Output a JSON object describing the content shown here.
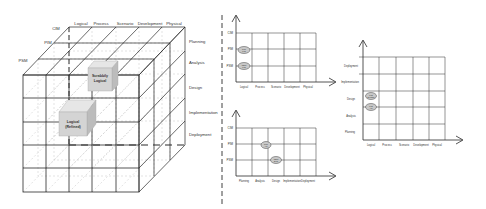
{
  "cube": {
    "depth_labels": [
      "CIM",
      "PIM",
      "PSM"
    ],
    "top_labels": [
      "Logical",
      "Process",
      "Scenario",
      "Development",
      "Physical"
    ],
    "side_labels": [
      "Planning",
      "Analysis",
      "Design",
      "Implementation",
      "Deployment"
    ],
    "blocks": [
      {
        "line1": "Scrabbily",
        "line2": "Logical"
      },
      {
        "line1": "Logical",
        "line2": "(Refined)"
      }
    ]
  },
  "chart_top": {
    "y_labels": [
      "CIM",
      "PIM",
      "PSM"
    ],
    "x_labels": [
      "Logical",
      "Process",
      "Scenario",
      "Development",
      "Physical"
    ],
    "markers": [
      {
        "line1": "PIM",
        "line2": "Log"
      },
      {
        "line1": "PSM",
        "line2": "Log"
      }
    ]
  },
  "chart_bottom": {
    "y_labels": [
      "CIM",
      "PIM",
      "PSM"
    ],
    "x_labels": [
      "Planning",
      "Analysis",
      "Design",
      "Implementation",
      "Deployment"
    ],
    "markers": [
      {
        "line1": "PIM",
        "line2": "Anl"
      },
      {
        "line1": "PSM",
        "line2": "Des"
      }
    ]
  },
  "chart_right": {
    "y_labels": [
      "Deployment",
      "Implementation",
      "Design",
      "Analysis",
      "Planning"
    ],
    "x_labels": [
      "Logical",
      "Process",
      "Scenario",
      "Development",
      "Physical"
    ],
    "markers": [
      {
        "line1": "Log",
        "line2": "Design"
      },
      {
        "line1": "Log",
        "line2": "Anl"
      }
    ]
  },
  "colors": {
    "line": "#2a2a2a",
    "grid_light": "#bdbdbd",
    "block_front": "#d4d4d4",
    "block_top": "#e6e6e6",
    "block_side": "#bcbcbc",
    "marker_fill": "#c8c8c8"
  }
}
